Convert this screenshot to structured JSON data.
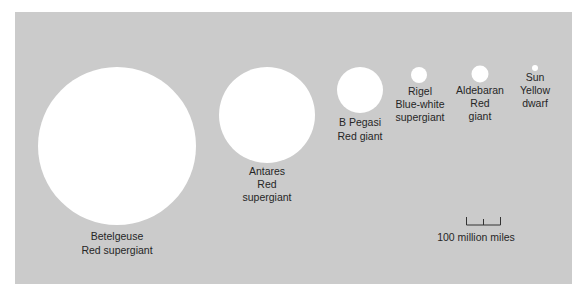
{
  "diagram": {
    "background_color": "#cbcbcb",
    "star_color": "#ffffff",
    "stars": [
      {
        "name": "Betelgeuse",
        "type_lines": [
          "Red supergiant"
        ]
      },
      {
        "name": "Antares",
        "type_lines": [
          "Red",
          "supergiant"
        ]
      },
      {
        "name": "B Pegasi",
        "type_lines": [
          "Red giant"
        ]
      },
      {
        "name": "Rigel",
        "type_lines": [
          "Blue-white",
          "supergiant"
        ]
      },
      {
        "name": "Aldebaran",
        "type_lines": [
          "Red",
          "giant"
        ]
      },
      {
        "name": "Sun",
        "type_lines": [
          "Yellow",
          "dwarf"
        ]
      }
    ],
    "scale_bar": {
      "label": "100 million miles"
    }
  }
}
